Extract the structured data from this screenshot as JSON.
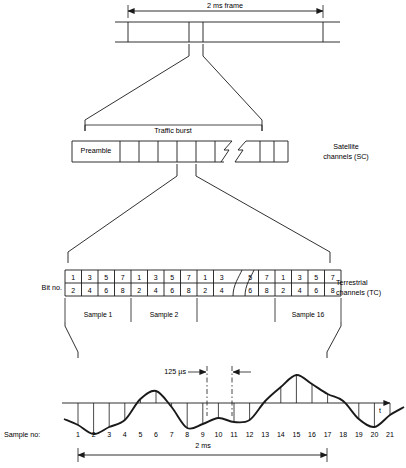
{
  "diagram": {
    "stroke_color": "#1a1a1a",
    "background": "#ffffff"
  },
  "tier1_frame": {
    "dimension_label": "2 ms frame",
    "bar": {
      "x": 115,
      "y": 22,
      "width": 225,
      "height": 20
    },
    "dividers": [
      128,
      189,
      203,
      323
    ],
    "dim_arrow": {
      "x1": 128,
      "x2": 323,
      "y": 11
    }
  },
  "tier2_burst": {
    "title": "Traffic burst",
    "side_label_line1": "Satellite",
    "side_label_line2": "channels (SC)",
    "preamble_label": "Preamble",
    "bar": {
      "x": 72,
      "y": 141,
      "width": 200,
      "height": 21
    },
    "preamble_width": 48,
    "cells_before_break": 6,
    "cells_after_break": 4,
    "bracket": {
      "x1": 85,
      "x2": 262,
      "y": 128
    }
  },
  "tier3_bits": {
    "row_label": "Bit no.",
    "side_label_line1": "Terrestrial",
    "side_label_line2": "channels (TC)",
    "table": {
      "x": 65,
      "y": 270,
      "cell_w": 16.5,
      "row_h": 13
    },
    "top_row": [
      1,
      3,
      5,
      7,
      1,
      3,
      5,
      7,
      1,
      3,
      5,
      7,
      1,
      3,
      5,
      7
    ],
    "bottom_row": [
      2,
      4,
      6,
      8,
      2,
      4,
      6,
      8,
      2,
      4,
      6,
      8,
      2,
      4,
      6,
      8
    ],
    "break_after_column": 10,
    "sample_groups": [
      {
        "label": "Sample 1",
        "start_col": 0,
        "end_col": 4
      },
      {
        "label": "Sample 2",
        "start_col": 4,
        "end_col": 8
      },
      {
        "label": "Sample 16",
        "start_col": 12,
        "end_col": 16
      }
    ],
    "sample_row_y": 310
  },
  "tier4_waveform": {
    "axis_label": "t",
    "interval_label": "125 µs",
    "sample_row_label": "Sample no:",
    "duration_label": "2 ms",
    "axis": {
      "y": 403,
      "x1": 62,
      "x2": 390
    },
    "sample_numbers": [
      1,
      2,
      3,
      4,
      5,
      6,
      7,
      8,
      9,
      10,
      11,
      12,
      13,
      14,
      15,
      16,
      17,
      18,
      19,
      20,
      21
    ],
    "sample_x_start": 78,
    "sample_x_step": 15.6,
    "sample_values": [
      -22,
      -31,
      -24,
      -17,
      4,
      12,
      -4,
      -25,
      -21,
      -15,
      -19,
      -17,
      2,
      16,
      28,
      19,
      9,
      2,
      -16,
      -24,
      -12
    ],
    "marker_lines": [
      207,
      232
    ],
    "dim_arrow": {
      "x1": 78,
      "x2": 327,
      "y": 455
    }
  }
}
